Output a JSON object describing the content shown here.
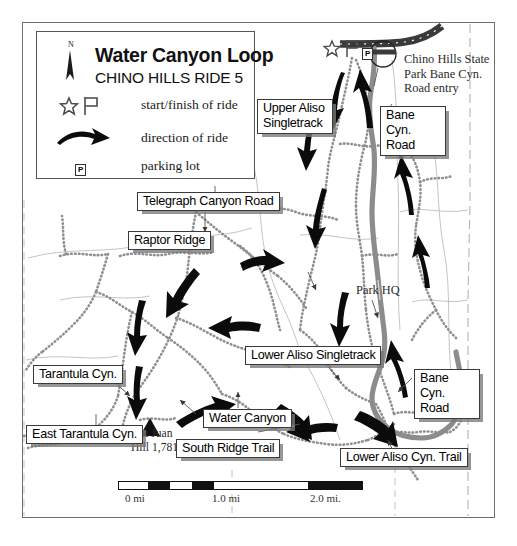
{
  "legend": {
    "title": "Water Canyon Loop",
    "subtitle": "CHINO HILLS RIDE 5",
    "north_label": "N",
    "rows": [
      {
        "icon": "star-flag-icon",
        "label": "start/finish of ride"
      },
      {
        "icon": "curved-arrow-icon",
        "label": "direction of ride"
      },
      {
        "icon": "parking-icon",
        "label": "parking lot"
      }
    ],
    "parking_glyph": "P"
  },
  "labels": [
    {
      "id": "upper-aliso-singletrack",
      "text": "Upper Aliso\nSingletrack",
      "line1": "Upper Aliso",
      "line2": "Singletrack"
    },
    {
      "id": "bane-cyn-road-north",
      "text": "Bane Cyn.\nRoad",
      "line1": "Bane Cyn.",
      "line2": "Road"
    },
    {
      "id": "telegraph-canyon-road",
      "text": "Telegraph Canyon Road"
    },
    {
      "id": "raptor-ridge",
      "text": "Raptor Ridge"
    },
    {
      "id": "lower-aliso-singletrack",
      "text": "Lower Aliso Singletrack"
    },
    {
      "id": "tarantula-cyn",
      "text": "Tarantula Cyn."
    },
    {
      "id": "east-tarantula-cyn",
      "text": "East Tarantula Cyn."
    },
    {
      "id": "water-canyon",
      "text": "Water Canyon"
    },
    {
      "id": "south-ridge-trail",
      "text": "South Ridge Trail"
    },
    {
      "id": "lower-aliso-cyn-trail",
      "text": "Lower Aliso Cyn. Trail"
    },
    {
      "id": "bane-cyn-road-south",
      "text": "Bane Cyn.\nRoad",
      "line1": "Bane Cyn.",
      "line2": "Road"
    }
  ],
  "annotations": [
    {
      "id": "park-entry-note",
      "line1": "Chino Hills State",
      "line2": "Park Bane Cyn.",
      "line3": "Road entry"
    },
    {
      "id": "park-hq",
      "text": "Park HQ"
    },
    {
      "id": "san-juan-hill",
      "line1": "San Juan",
      "line2": "Hill 1,781'"
    }
  ],
  "scale": {
    "ticks": [
      "0 mi",
      "1.0 mi",
      "2.0 mi."
    ],
    "segments": [
      {
        "fill": "#ffffff"
      },
      {
        "fill": "#111111"
      },
      {
        "fill": "#ffffff"
      },
      {
        "fill": "#111111"
      },
      {
        "fill": "#ffffff"
      },
      {
        "fill": "#ffffff"
      },
      {
        "fill": "#111111"
      }
    ]
  },
  "colors": {
    "road": "#8c8c8c",
    "highway": "#3a3a3a",
    "trail": "#9a9a9a",
    "frame": "#6e6e6e",
    "label_shadow": "#7b7b7b",
    "ink": "#000000"
  }
}
